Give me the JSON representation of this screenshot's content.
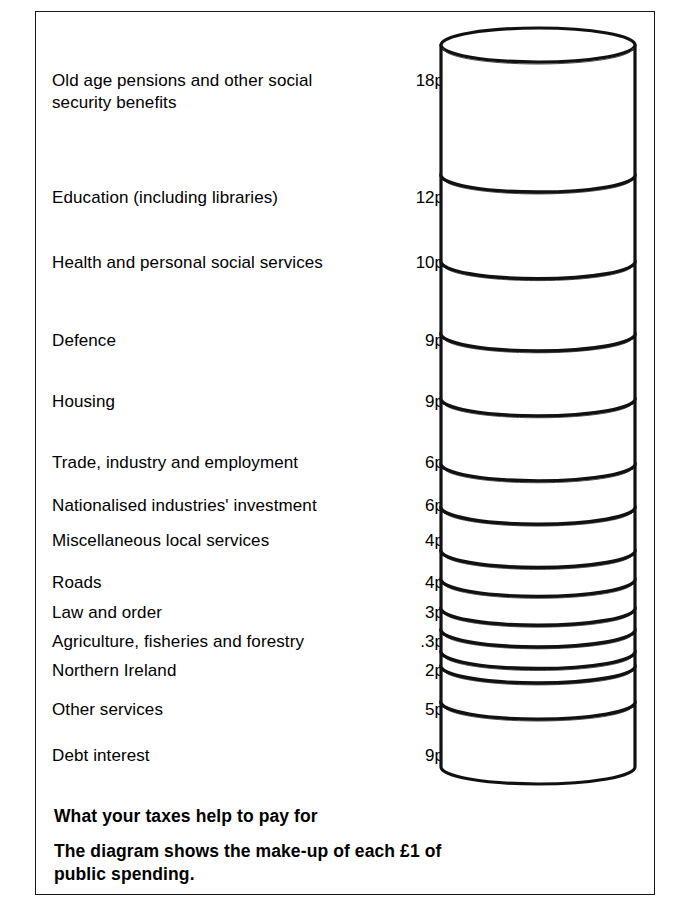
{
  "frame": {
    "border_color": "#1a1a1a"
  },
  "caption": {
    "heading": "What your taxes help to pay for",
    "subtext": "The diagram shows the make-up of each £1 of public spending."
  },
  "units": "p",
  "chart_data": {
    "type": "bar",
    "title": "What your taxes help to pay for",
    "subtitle": "The diagram shows the make-up of each £1 of public spending.",
    "xlabel": "",
    "ylabel": "Pence per £1 of public spending",
    "ylim": [
      0,
      100
    ],
    "total": 100,
    "orientation": "stacked-vertical-cylinder",
    "grid": false,
    "legend": "none",
    "categories": [
      "Old age pensions and other social\nsecurity benefits",
      "Education (including libraries)",
      "Health and personal social services",
      "Defence",
      "Housing",
      "Trade, industry and employment",
      "Nationalised industries' investment",
      "Miscellaneous local services",
      "Roads",
      "Law and order",
      "Agriculture, fisheries and forestry",
      "Northern Ireland",
      "Other services",
      "Debt interest"
    ],
    "values": [
      18,
      12,
      10,
      9,
      9,
      6,
      6,
      4,
      4,
      3,
      3,
      2,
      5,
      9
    ],
    "value_labels": [
      "18p",
      "12p",
      "10p",
      "9p",
      "9p",
      "6p",
      "6p",
      "4p",
      "4p",
      "3p",
      ".3p",
      "2p",
      "5p",
      "9p"
    ]
  },
  "rows": [
    {
      "label": "Old age pensions and other social\nsecurity benefits",
      "value": "18p",
      "top": 70,
      "label_top": 0
    },
    {
      "label": "Education (including libraries)",
      "value": "12p",
      "top": 187,
      "label_top": 0
    },
    {
      "label": "Health and personal social services",
      "value": "10p",
      "top": 252,
      "label_top": 0
    },
    {
      "label": "Defence",
      "value": "9p",
      "top": 330,
      "label_top": 0
    },
    {
      "label": "Housing",
      "value": "9p",
      "top": 391,
      "label_top": 0
    },
    {
      "label": "Trade, industry and employment",
      "value": "6p",
      "top": 452,
      "label_top": 0
    },
    {
      "label": "Nationalised industries' investment",
      "value": "6p",
      "top": 495,
      "label_top": 0
    },
    {
      "label": "Miscellaneous local services",
      "value": "4p",
      "top": 530,
      "label_top": 0
    },
    {
      "label": "Roads",
      "value": "4p",
      "top": 572,
      "label_top": 0
    },
    {
      "label": "Law and order",
      "value": "3p",
      "top": 602,
      "label_top": 0
    },
    {
      "label": "Agriculture, fisheries and forestry",
      "value": ".3p",
      "top": 631,
      "label_top": 0
    },
    {
      "label": "Northern Ireland",
      "value": "2p",
      "top": 660,
      "label_top": 0
    },
    {
      "label": "Other services",
      "value": "5p",
      "top": 699,
      "label_top": 0
    },
    {
      "label": "Debt interest",
      "value": "9p",
      "top": 745,
      "label_top": 0
    }
  ]
}
